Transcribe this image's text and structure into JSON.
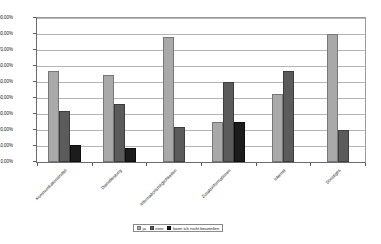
{
  "chart_data": {
    "type": "bar",
    "title": "",
    "subtitle": "",
    "xlabel": "",
    "ylabel": "",
    "ylim": [
      0,
      90
    ],
    "ytick_labels": [
      "90.00%",
      "80.00%",
      "70.00%",
      "60.00%",
      "50.00%",
      "40.00%",
      "30.00%",
      "20.00%",
      "10.00%",
      "0.00%"
    ],
    "ytick_values": [
      90,
      80,
      70,
      60,
      50,
      40,
      30,
      20,
      10,
      0
    ],
    "grid": true,
    "legend_position": "bottom-center",
    "categories": [
      "Kommunikationsmittel",
      "Dienstleistung",
      "Informationsmöglichkeiten",
      "Zusatzinformationen",
      "Internet",
      "Sonstiges"
    ],
    "series": [
      {
        "name": "ja",
        "color": "#a9a9a9",
        "values": [
          57.0,
          54.5,
          78.0,
          25.0,
          42.5,
          80.0
        ]
      },
      {
        "name": "nein",
        "color": "#5b5b5b",
        "values": [
          32.0,
          36.0,
          22.0,
          50.0,
          57.0,
          20.0
        ]
      },
      {
        "name": "kann ich nicht beurteilen",
        "color": "#1c1c1c",
        "values": [
          10.5,
          9.0,
          null,
          25.0,
          null,
          null
        ]
      }
    ]
  },
  "legend": {
    "items": [
      {
        "label": "ja",
        "swatch_class": "s0"
      },
      {
        "label": "nein",
        "swatch_class": "s1"
      },
      {
        "label": "kann ich nicht beurteilen",
        "swatch_class": "s2"
      }
    ]
  }
}
